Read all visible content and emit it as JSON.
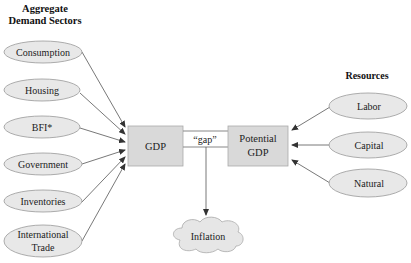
{
  "headings": {
    "left_line1": "Aggregate",
    "left_line2": "Demand Sectors",
    "right": "Resources"
  },
  "demand_sectors": [
    {
      "label": "Consumption"
    },
    {
      "label": "Housing"
    },
    {
      "label": "BFI*"
    },
    {
      "label": "Government"
    },
    {
      "label": "Inventories"
    },
    {
      "label_line1": "International",
      "label_line2": "Trade"
    }
  ],
  "center": {
    "gdp_label": "GDP",
    "potential_line1": "Potential",
    "potential_line2": "GDP",
    "gap_label": "“gap”",
    "inflation_label": "Inflation"
  },
  "resources": [
    {
      "label": "Labor"
    },
    {
      "label": "Capital"
    },
    {
      "label": "Natural"
    }
  ],
  "colors": {
    "shape_fill": "#e6e6e6",
    "box_fill": "#d9d9d9",
    "stroke": "#8a8a8a",
    "arrow": "#444444"
  }
}
